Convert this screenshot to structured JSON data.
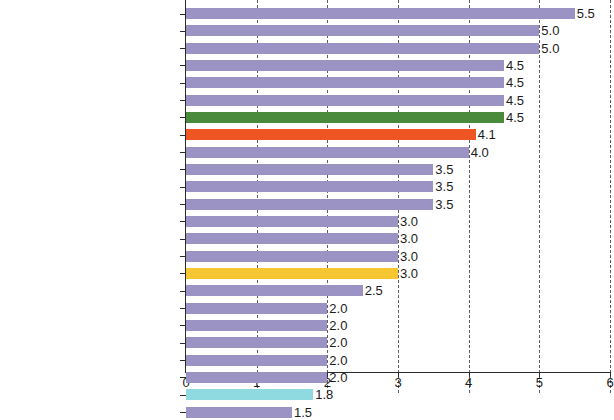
{
  "chart_data": {
    "type": "bar",
    "orientation": "horizontal",
    "title": "",
    "subtitle": "",
    "xlabel": "",
    "ylabel": "",
    "xlim": [
      0,
      6
    ],
    "xticks": [
      "0",
      "1",
      "2",
      "3",
      "4",
      "5",
      "6"
    ],
    "grid": "vertical-dashed",
    "legend": "none",
    "value_label_format": "one-decimal",
    "categories": [
      "Brazil",
      "Uruguay",
      "Peru",
      "Panama",
      "Chile",
      "Bolivia (Plur. State of)",
      "South America",
      "Latin America and the Caribbean",
      "Argentina",
      "Dominican Republic",
      "Mexico",
      "Costa Rica",
      "Paraguay",
      "Ecuador",
      "Cuba",
      "Central America",
      "Colombia",
      "Venezuela (Bol. Rep. of)",
      "Nicaragua",
      "Haiti",
      "Guatemala",
      "El Salvador",
      "The Caribbean",
      "Honduras"
    ],
    "values": [
      5.5,
      5.0,
      5.0,
      4.5,
      4.5,
      4.5,
      4.5,
      4.1,
      4.0,
      3.5,
      3.5,
      3.5,
      3.0,
      3.0,
      3.0,
      3.0,
      2.5,
      2.0,
      2.0,
      2.0,
      2.0,
      2.0,
      1.8,
      1.5
    ],
    "value_labels": [
      "5.5",
      "5.0",
      "5.0",
      "4.5",
      "4.5",
      "4.5",
      "4.5",
      "4.1",
      "4.0",
      "3.5",
      "3.5",
      "3.5",
      "3.0",
      "3.0",
      "3.0",
      "3.0",
      "2.5",
      "2.0",
      "2.0",
      "2.0",
      "2.0",
      "2.0",
      "1.8",
      "1.5"
    ],
    "bar_colors": [
      "#9b93c4",
      "#9b93c4",
      "#9b93c4",
      "#9b93c4",
      "#9b93c4",
      "#9b93c4",
      "#4a8a3c",
      "#ef5423",
      "#9b93c4",
      "#9b93c4",
      "#9b93c4",
      "#9b93c4",
      "#9b93c4",
      "#9b93c4",
      "#9b93c4",
      "#f7c733",
      "#9b93c4",
      "#9b93c4",
      "#9b93c4",
      "#9b93c4",
      "#9b93c4",
      "#9b93c4",
      "#8fd9e0",
      "#9b93c4"
    ],
    "colors": {
      "country_bar": "#9b93c4",
      "south_america_bar": "#4a8a3c",
      "latin_america_caribbean_bar": "#ef5423",
      "central_america_bar": "#f7c733",
      "the_caribbean_bar": "#8fd9e0",
      "axis": "#2b2b2b",
      "gridline": "#5c5c66",
      "background": "#ffffff",
      "text": "#121212"
    }
  }
}
